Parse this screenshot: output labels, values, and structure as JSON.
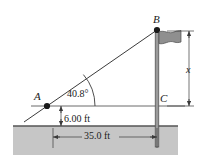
{
  "figure": {
    "type": "geometry-diagram",
    "points": {
      "A": {
        "label": "A",
        "x_px": 47,
        "y_px": 106,
        "role": "observer-point"
      },
      "B": {
        "label": "B",
        "x_px": 157,
        "y_px": 30,
        "role": "flagpole-top"
      },
      "C": {
        "label": "C",
        "x_px": 157,
        "y_px": 106,
        "role": "pole-at-eye-level"
      }
    },
    "dimensions": [
      {
        "name": "angle-of-elevation",
        "label": "40.8°",
        "value": 40.8,
        "unit": "deg",
        "at": "A"
      },
      {
        "name": "height-above-ground",
        "label": "6.00 ft",
        "value": 6.0,
        "unit": "ft",
        "orientation": "vertical"
      },
      {
        "name": "horizontal-distance",
        "label": "35.0 ft",
        "value": 35.0,
        "unit": "ft",
        "orientation": "horizontal"
      },
      {
        "name": "unknown-height",
        "label": "x",
        "value": null,
        "unit": "ft",
        "orientation": "vertical"
      }
    ],
    "objects": {
      "flag": {
        "name": "flag",
        "color": "#8a8a8a"
      },
      "pole": {
        "name": "flagpole",
        "color": "#6e6e6e"
      },
      "ground": {
        "name": "ground-block",
        "color": "#c6c6c6"
      }
    },
    "colors": {
      "line": "#3b3b3b",
      "ground_fill": "#c6c6c6",
      "ground_edge": "#555555",
      "flag_fill": "#8f8f8f",
      "pole_fill": "#9a9a9a",
      "text": "#1a1a1a"
    }
  }
}
